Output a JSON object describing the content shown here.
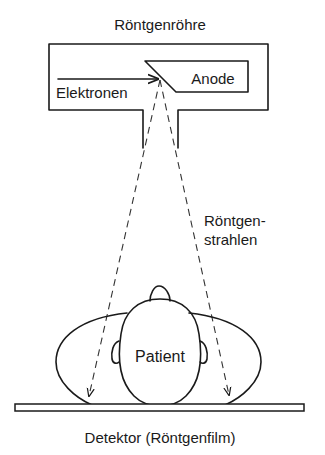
{
  "diagram": {
    "title": "Röntgenröhre",
    "labels": {
      "anode": "Anode",
      "electrons": "Elektronen",
      "xrays_line1": "Röntgen-",
      "xrays_line2": "strahlen",
      "patient": "Patient",
      "detector": "Detektor (Röntgenfilm)"
    },
    "colors": {
      "line": "#1a1a1a",
      "background": "#ffffff"
    }
  }
}
